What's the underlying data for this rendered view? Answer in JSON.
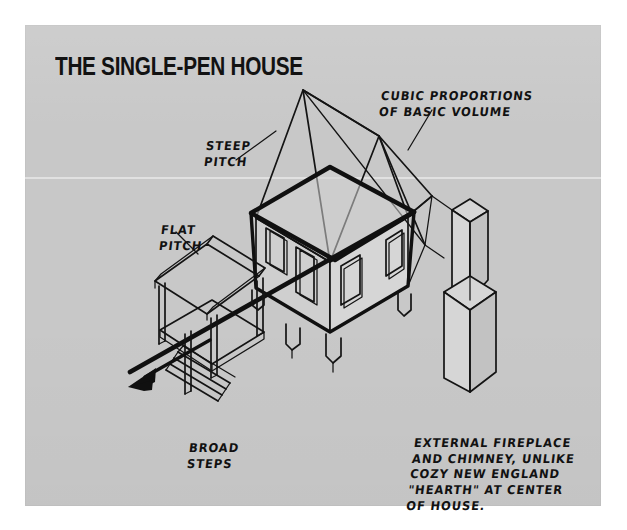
{
  "page": {
    "title": "THE SINGLE-PEN HOUSE",
    "background_color": "#ffffff",
    "board_color": "#c8c8c8",
    "ink_color": "#141414"
  },
  "annotations": {
    "steep_pitch": "STEEP\nPITCH",
    "cubic_proportions": "CUBIC PROPORTIONS\nOF BASIC VOLUME",
    "flat_pitch": "FLAT\nPITCH",
    "broad_steps": "BROAD\nSTEPS",
    "fireplace": "EXTERNAL FIREPLACE\nAND CHIMNEY, UNLIKE\nCOZY NEW ENGLAND\n\"HEARTH\" AT CENTER\nOF HOUSE."
  },
  "figure": {
    "type": "axonometric-architectural-sketch",
    "subject": "single-pen house",
    "elements": [
      "gable-roof",
      "main-volume",
      "cubic-volume-overlay",
      "porch-shed-roof",
      "porch-posts",
      "broad-steps",
      "external-chimney",
      "foundation-piers",
      "windows",
      "door",
      "direction-arrow"
    ]
  }
}
